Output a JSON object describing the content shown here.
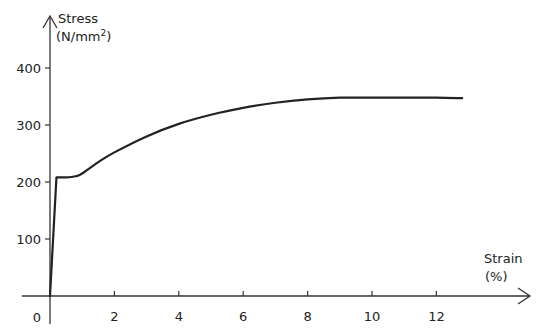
{
  "chart_data": {
    "type": "line",
    "title": "",
    "xlabel": "Strain",
    "xlabel_unit": "(%)",
    "ylabel": "Stress",
    "ylabel_unit_prefix": "(N/mm",
    "ylabel_unit_sup": "2",
    "ylabel_unit_suffix": ")",
    "origin_label": "0",
    "xlim": [
      0,
      14
    ],
    "ylim": [
      0,
      420
    ],
    "grid": false,
    "legend": "none",
    "x_ticks": [
      2,
      4,
      6,
      8,
      10,
      12
    ],
    "x_tick_labels": [
      "2",
      "4",
      "6",
      "8",
      "10",
      "12"
    ],
    "y_ticks": [
      100,
      200,
      300,
      400
    ],
    "y_tick_labels": [
      "100",
      "200",
      "300",
      "400"
    ],
    "series": [
      {
        "name": "Stress-strain curve",
        "color": "#222222",
        "x": [
          0,
          0.2,
          0.5,
          0.8,
          1.0,
          1.5,
          2.0,
          3.0,
          4.0,
          5.0,
          6.0,
          7.0,
          8.0,
          9.0,
          10.0,
          11.0,
          12.0,
          12.8
        ],
        "y": [
          0,
          208,
          208,
          210,
          215,
          235,
          252,
          280,
          302,
          318,
          330,
          339,
          345,
          348,
          348,
          348,
          348,
          347
        ]
      }
    ]
  }
}
